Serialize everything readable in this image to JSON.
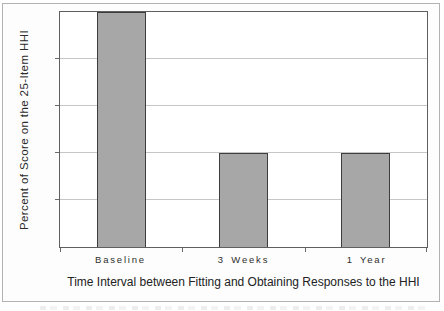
{
  "chart_data": {
    "type": "bar",
    "categories": [
      "Baseline",
      "3 Weeks",
      "1 Year"
    ],
    "values": [
      100,
      40,
      40
    ],
    "title": "",
    "xlabel": "Time Interval between Fitting and Obtaining Responses to the HHI",
    "ylabel": "Percent of Score on the 25-Item HHI",
    "ylim": [
      0,
      100
    ],
    "y_tick_labels": [],
    "gridline_values": [
      20,
      40,
      60,
      80
    ],
    "grid": "horizontal",
    "legend": "none",
    "colors": {
      "bar_fill": "#a7a7a7",
      "bar_border": "#3d3d3d",
      "plot_border": "#5f5f5f",
      "gridline": "#c6c6c6",
      "figure_border": "#b2b2b2",
      "text": "#2b2b2b"
    }
  }
}
